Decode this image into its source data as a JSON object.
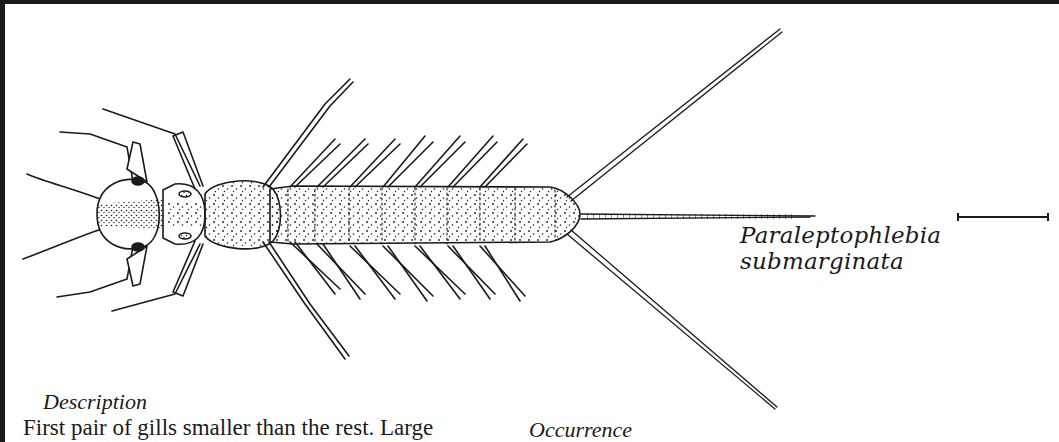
{
  "figure": {
    "species_name": "Paraleptophlebia submarginata",
    "scale_bar": "scale-bar"
  },
  "description": {
    "heading": "Description",
    "text": "First pair of gills smaller than the rest. Large"
  },
  "occurrence": {
    "heading": "Occurrence"
  },
  "colors": {
    "ink": "#1a1a1a",
    "paper": "#ffffff"
  }
}
